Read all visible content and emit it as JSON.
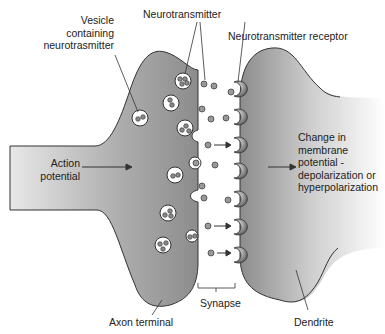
{
  "labels": {
    "vesicle": [
      "Vesicle",
      "containing",
      "neurotrasmitter"
    ],
    "neurotransmitter": "Neurotransmitter",
    "receptor": "Neurotransmitter receptor",
    "action_potential": [
      "Action",
      "potential"
    ],
    "change": [
      "Change in",
      "membrane",
      "potential -",
      "depolarization or",
      "hyperpolarization"
    ],
    "axon_terminal": "Axon terminal",
    "synapse": "Synapse",
    "dendrite": "Dendrite"
  },
  "colors": {
    "neuron_fill_dark": "#8a8a8a",
    "neuron_fill_light": "#f2f2f2",
    "outline": "#333333",
    "receptor": "#777777"
  }
}
